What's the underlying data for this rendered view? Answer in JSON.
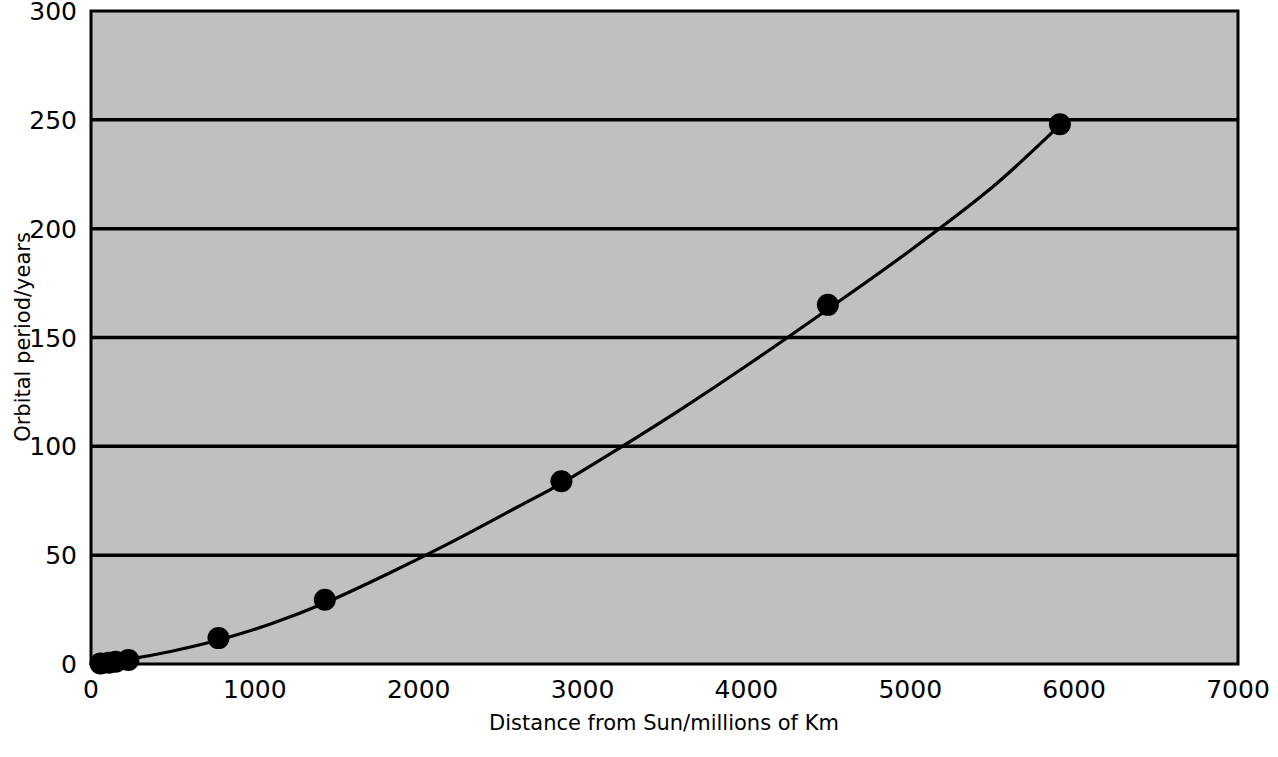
{
  "chart_data": {
    "type": "scatter",
    "title": "",
    "subtitle": "",
    "xlabel": "Distance from Sun/millions of Km",
    "ylabel": "Orbital period/years",
    "xlim": [
      0,
      7000
    ],
    "ylim": [
      0,
      300
    ],
    "xticks": [
      0,
      1000,
      2000,
      3000,
      4000,
      5000,
      6000,
      7000
    ],
    "xtick_labels": [
      "0",
      "1000",
      "2000",
      "3000",
      "4000",
      "5000",
      "6000",
      "7000"
    ],
    "yticks": [
      0,
      50,
      100,
      150,
      200,
      250,
      300
    ],
    "ytick_labels": [
      "0",
      "50",
      "100",
      "150",
      "200",
      "250",
      "300"
    ],
    "grid": "horizontal",
    "legend": "none",
    "plot_background": "#c0c0c0",
    "line_color": "#000000",
    "marker_color": "#000000",
    "marker_shape": "circle",
    "has_fitted_curve": true,
    "series": [
      {
        "name": "Orbital period vs distance",
        "x": [
          58,
          108,
          150,
          228,
          778,
          1427,
          2871,
          4497,
          5913
        ],
        "y": [
          0.24,
          0.62,
          1.0,
          1.88,
          11.9,
          29.5,
          84.0,
          165.0,
          248.0
        ]
      }
    ],
    "points": [
      {
        "x": 58,
        "y": 0.24
      },
      {
        "x": 108,
        "y": 0.62
      },
      {
        "x": 150,
        "y": 1.0
      },
      {
        "x": 228,
        "y": 1.88
      },
      {
        "x": 778,
        "y": 11.9
      },
      {
        "x": 1427,
        "y": 29.5
      },
      {
        "x": 2871,
        "y": 84.0
      },
      {
        "x": 4497,
        "y": 165.0
      },
      {
        "x": 5913,
        "y": 248.0
      }
    ],
    "curve": [
      {
        "x": 0,
        "y": 0
      },
      {
        "x": 250,
        "y": 2.5
      },
      {
        "x": 500,
        "y": 6.0
      },
      {
        "x": 778,
        "y": 11.0
      },
      {
        "x": 1100,
        "y": 18.5
      },
      {
        "x": 1427,
        "y": 28.0
      },
      {
        "x": 1800,
        "y": 41.0
      },
      {
        "x": 2200,
        "y": 56.0
      },
      {
        "x": 2600,
        "y": 72.0
      },
      {
        "x": 2871,
        "y": 83.0
      },
      {
        "x": 3200,
        "y": 98.0
      },
      {
        "x": 3600,
        "y": 117.0
      },
      {
        "x": 4000,
        "y": 137.0
      },
      {
        "x": 4497,
        "y": 163.0
      },
      {
        "x": 5000,
        "y": 190.0
      },
      {
        "x": 5500,
        "y": 219.0
      },
      {
        "x": 5913,
        "y": 247.5
      }
    ]
  }
}
